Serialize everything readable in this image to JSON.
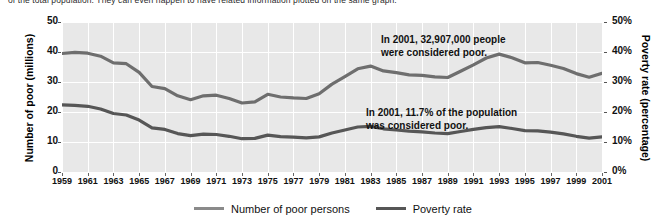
{
  "caption": {
    "text": "of the total population. They can even happen to have related information plotted on the same graph."
  },
  "chart_data": {
    "type": "line",
    "title": "",
    "xlabel": "",
    "ylabel": "Number of poor (millions)",
    "y2label": "Poverty rate (percentage)",
    "xlim": [
      1959,
      2001
    ],
    "ylim": [
      0,
      50
    ],
    "y2lim": [
      0,
      50
    ],
    "grid": true,
    "legend_position": "bottom",
    "x": [
      1959,
      1960,
      1961,
      1962,
      1963,
      1964,
      1965,
      1966,
      1967,
      1968,
      1969,
      1970,
      1971,
      1972,
      1973,
      1974,
      1975,
      1976,
      1977,
      1978,
      1979,
      1980,
      1981,
      1982,
      1983,
      1984,
      1985,
      1986,
      1987,
      1988,
      1989,
      1990,
      1991,
      1992,
      1993,
      1994,
      1995,
      1996,
      1997,
      1998,
      1999,
      2000,
      2001
    ],
    "xticks": [
      "1959",
      "1961",
      "1963",
      "1965",
      "1967",
      "1969",
      "1971",
      "1973",
      "1975",
      "1977",
      "1979",
      "1981",
      "1983",
      "1985",
      "1987",
      "1989",
      "1991",
      "1993",
      "1995",
      "1997",
      "1999",
      "2001"
    ],
    "yticks_left": [
      "0",
      "10",
      "20",
      "30",
      "40",
      "50"
    ],
    "yticks_right": [
      "0%",
      "10%",
      "20%",
      "30%",
      "40%",
      "50%"
    ],
    "series": [
      {
        "name": "Number of poor persons",
        "axis": "left",
        "units": "millions",
        "color": "#6e6e6e",
        "values": [
          39.5,
          39.9,
          39.6,
          38.6,
          36.4,
          36.1,
          33.2,
          28.5,
          27.8,
          25.4,
          24.1,
          25.4,
          25.6,
          24.5,
          23.0,
          23.4,
          25.9,
          25.0,
          24.7,
          24.5,
          26.1,
          29.3,
          31.8,
          34.4,
          35.3,
          33.7,
          33.1,
          32.4,
          32.2,
          31.7,
          31.5,
          33.6,
          35.7,
          38.0,
          39.3,
          38.1,
          36.4,
          36.5,
          35.6,
          34.5,
          32.8,
          31.6,
          32.9
        ]
      },
      {
        "name": "Poverty rate",
        "axis": "right",
        "units": "percent",
        "color": "#565656",
        "values": [
          22.4,
          22.2,
          21.9,
          21.0,
          19.5,
          19.0,
          17.3,
          14.7,
          14.2,
          12.8,
          12.1,
          12.6,
          12.5,
          11.9,
          11.1,
          11.2,
          12.3,
          11.8,
          11.6,
          11.4,
          11.7,
          13.0,
          14.0,
          15.0,
          15.2,
          14.4,
          14.0,
          13.6,
          13.4,
          13.0,
          12.8,
          13.5,
          14.2,
          14.8,
          15.1,
          14.5,
          13.8,
          13.7,
          13.3,
          12.7,
          11.9,
          11.3,
          11.7
        ]
      }
    ],
    "annotations": [
      {
        "id": "annotation-count",
        "line1": "In 2001, 32,907,000 people",
        "line2": "were considered poor."
      },
      {
        "id": "annotation-rate",
        "line1": "In 2001, 11.7% of the population",
        "line2": "was considered poor."
      }
    ]
  },
  "legend": {
    "items": [
      {
        "label": "Number of poor persons",
        "color": "#8a8a8a"
      },
      {
        "label": "Poverty rate",
        "color": "#565656"
      }
    ]
  }
}
